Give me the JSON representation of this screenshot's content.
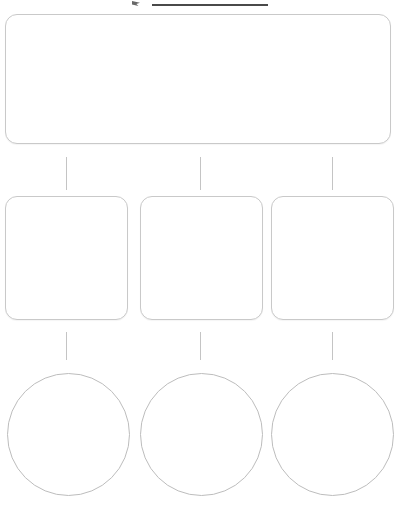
{
  "heading": {
    "text": "",
    "marker_icon": "arrow-marker-icon",
    "underline_visible": true
  },
  "diagram": {
    "type": "hierarchy-flowchart",
    "title": "",
    "background_color": "#ffffff",
    "border_color": "#c9c9c9",
    "connector_color": "#c4c4c4",
    "levels": [
      {
        "level": 1,
        "shape": "rounded-rectangle",
        "count": 1,
        "nodes": [
          {
            "id": "root",
            "label": ""
          }
        ]
      },
      {
        "level": 2,
        "shape": "rounded-square",
        "count": 3,
        "nodes": [
          {
            "id": "branch-1",
            "label": ""
          },
          {
            "id": "branch-2",
            "label": ""
          },
          {
            "id": "branch-3",
            "label": ""
          }
        ]
      },
      {
        "level": 3,
        "shape": "circle",
        "count": 3,
        "nodes": [
          {
            "id": "leaf-1",
            "label": ""
          },
          {
            "id": "leaf-2",
            "label": ""
          },
          {
            "id": "leaf-3",
            "label": ""
          }
        ]
      }
    ],
    "connectors": [
      {
        "id": "root-to-branch-1",
        "orientation": "vertical"
      },
      {
        "id": "root-to-branch-2",
        "orientation": "vertical"
      },
      {
        "id": "root-to-branch-3",
        "orientation": "vertical"
      },
      {
        "id": "branch-1-to-leaf-1",
        "orientation": "vertical"
      },
      {
        "id": "branch-2-to-leaf-2",
        "orientation": "vertical"
      },
      {
        "id": "branch-3-to-leaf-3",
        "orientation": "vertical"
      }
    ]
  }
}
